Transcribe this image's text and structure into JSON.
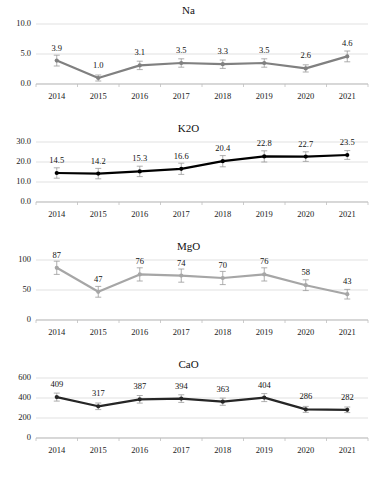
{
  "charts": [
    {
      "id": "na",
      "title": "Na",
      "type": "line",
      "categories": [
        "2014",
        "2015",
        "2016",
        "2017",
        "2018",
        "2019",
        "2020",
        "2021"
      ],
      "values": [
        3.9,
        1.0,
        3.1,
        3.5,
        3.3,
        3.5,
        2.6,
        4.6
      ],
      "labels": [
        "3.9",
        "1.0",
        "3.1",
        "3.5",
        "3.3",
        "3.5",
        "2.6",
        "4.6"
      ],
      "yticks": [
        "0.0",
        "5.0",
        "10.0"
      ],
      "ytickvals": [
        0.0,
        5.0,
        10.0
      ],
      "ylim": [
        0.0,
        10.0
      ],
      "color": "#808080",
      "errors": [
        0.9,
        0.5,
        0.7,
        0.7,
        0.7,
        0.7,
        0.6,
        0.9
      ]
    },
    {
      "id": "k2o",
      "title": "K2O",
      "type": "line",
      "categories": [
        "2014",
        "2015",
        "2016",
        "2017",
        "2018",
        "2019",
        "2020",
        "2021"
      ],
      "values": [
        14.5,
        14.2,
        15.3,
        16.6,
        20.4,
        22.8,
        22.7,
        23.5
      ],
      "labels": [
        "14.5",
        "14.2",
        "15.3",
        "16.6",
        "20.4",
        "22.8",
        "22.7",
        "23.5"
      ],
      "yticks": [
        "0.0",
        "10.0",
        "20.0",
        "30.0"
      ],
      "ytickvals": [
        0.0,
        10.0,
        20.0,
        30.0
      ],
      "ylim": [
        0.0,
        30.0
      ],
      "color": "#000000",
      "errors": [
        2.6,
        2.6,
        2.6,
        2.8,
        2.8,
        2.8,
        2.4,
        2.2
      ]
    },
    {
      "id": "mgo",
      "title": "MgO",
      "type": "line",
      "categories": [
        "2014",
        "2015",
        "2016",
        "2017",
        "2018",
        "2019",
        "2020",
        "2021"
      ],
      "values": [
        87,
        47,
        76,
        74,
        70,
        76,
        58,
        43
      ],
      "labels": [
        "87",
        "47",
        "76",
        "74",
        "70",
        "76",
        "58",
        "43"
      ],
      "yticks": [
        "0",
        "50",
        "100"
      ],
      "ytickvals": [
        0,
        50,
        100
      ],
      "ylim": [
        0,
        100
      ],
      "color": "#a6a6a6",
      "errors": [
        11,
        9,
        11,
        11,
        11,
        11,
        9,
        8
      ]
    },
    {
      "id": "cao",
      "title": "CaO",
      "type": "line",
      "categories": [
        "2014",
        "2015",
        "2016",
        "2017",
        "2018",
        "2019",
        "2020",
        "2021"
      ],
      "values": [
        409,
        317,
        387,
        394,
        363,
        404,
        286,
        282
      ],
      "labels": [
        "409",
        "317",
        "387",
        "394",
        "363",
        "404",
        "286",
        "282"
      ],
      "yticks": [
        "0",
        "200",
        "400",
        "600"
      ],
      "ytickvals": [
        0,
        200,
        400,
        600
      ],
      "ylim": [
        0,
        600
      ],
      "color": "#262626",
      "errors": [
        40,
        33,
        38,
        38,
        36,
        40,
        30,
        28
      ]
    }
  ]
}
